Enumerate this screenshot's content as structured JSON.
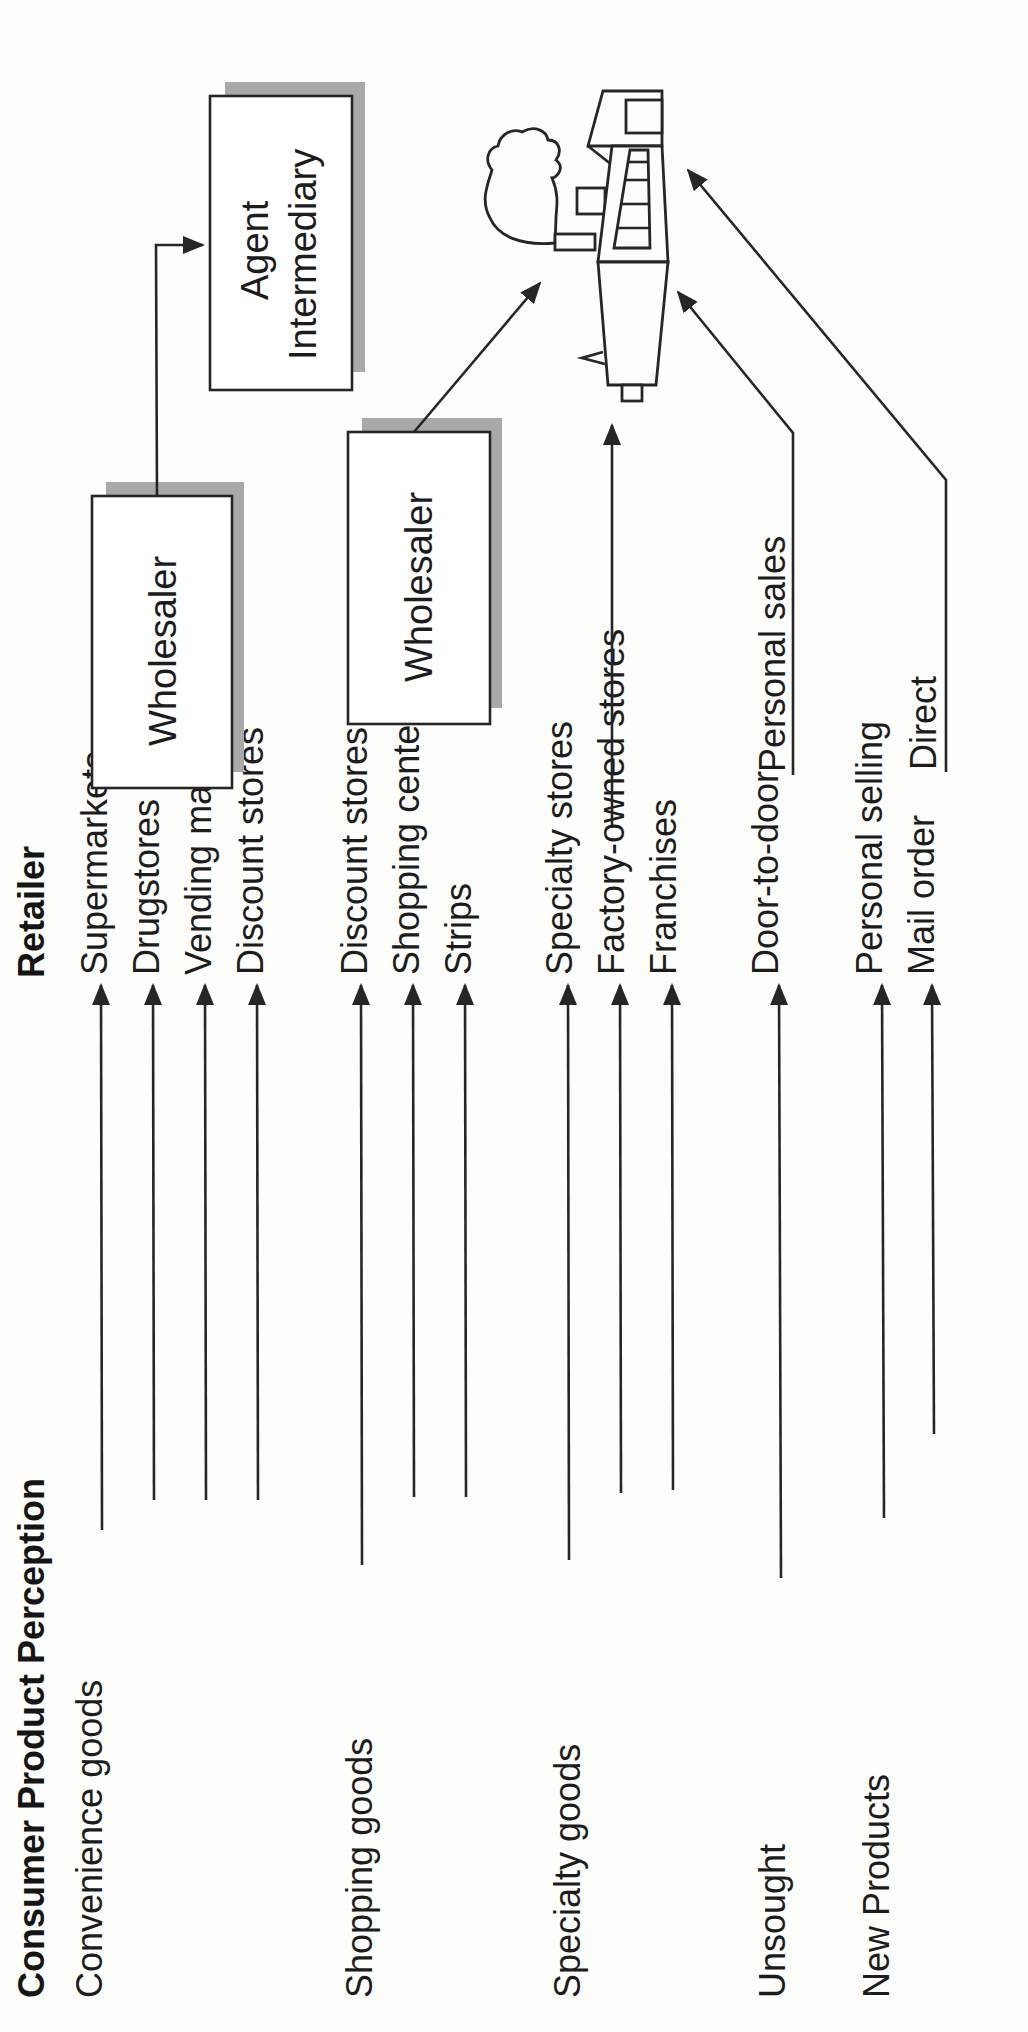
{
  "header": {
    "perception_title": "Consumer Product Perception",
    "retailer_title": "Retailer"
  },
  "categories": [
    {
      "label": "Convenience goods",
      "retailers": [
        "Supermarkets",
        "Drugstores",
        "Vending machines",
        "Discount stores"
      ]
    },
    {
      "label": "Shopping goods",
      "retailers": [
        "Discount stores",
        "Shopping centers (malls)",
        "Strips"
      ]
    },
    {
      "label": "Specialty goods",
      "retailers": [
        "Specialty stores",
        "Factory-owned stores",
        "Franchises"
      ]
    },
    {
      "label": "Unsought",
      "retailers": [
        "Door-to-door"
      ]
    },
    {
      "label": "New Products",
      "retailers": [
        "Personal selling",
        "Mail order"
      ]
    }
  ],
  "intermediaries": {
    "wholesaler_1": "Wholesaler",
    "wholesaler_2": "Wholesaler",
    "agent_line1": "Agent",
    "agent_line2": "Intermediary"
  },
  "manufacturer_channels": {
    "personal_sales": "Personal sales",
    "direct": "Direct"
  },
  "icons": {
    "manufacturer": "factory-icon",
    "arrow": "arrow-head"
  },
  "colors": {
    "ink": "#262626",
    "shadow": "#a9a9a9",
    "paper": "#fdfdfc"
  }
}
